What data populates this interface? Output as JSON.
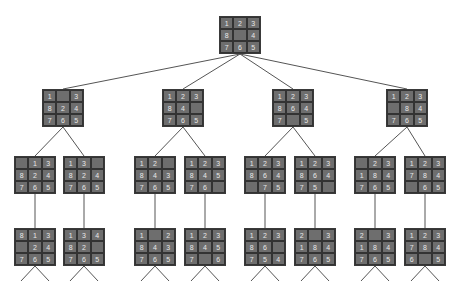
{
  "colors": {
    "tile": "#6e6e6e",
    "border": "#333333",
    "digit": "#e8e8e8",
    "edge": "#555555"
  },
  "nodes": [
    {
      "id": "root",
      "level": 1,
      "x": 219,
      "y": 16,
      "cells": [
        "1",
        "2",
        "3",
        "8",
        "",
        "4",
        "7",
        "6",
        "5"
      ]
    },
    {
      "id": "n2a",
      "level": 2,
      "x": 42,
      "y": 89,
      "cells": [
        "1",
        "",
        "3",
        "8",
        "2",
        "4",
        "7",
        "6",
        "5"
      ]
    },
    {
      "id": "n2b",
      "level": 2,
      "x": 162,
      "y": 89,
      "cells": [
        "1",
        "2",
        "3",
        "8",
        "4",
        "",
        "7",
        "6",
        "5"
      ]
    },
    {
      "id": "n2c",
      "level": 2,
      "x": 272,
      "y": 89,
      "cells": [
        "1",
        "2",
        "3",
        "8",
        "6",
        "4",
        "7",
        "",
        "5"
      ]
    },
    {
      "id": "n2d",
      "level": 2,
      "x": 386,
      "y": 89,
      "cells": [
        "1",
        "2",
        "3",
        "",
        "8",
        "4",
        "7",
        "6",
        "5"
      ]
    },
    {
      "id": "n3a",
      "level": 3,
      "x": 14,
      "y": 156,
      "cells": [
        "",
        "1",
        "3",
        "8",
        "2",
        "4",
        "7",
        "6",
        "5"
      ]
    },
    {
      "id": "n3b",
      "level": 3,
      "x": 63,
      "y": 156,
      "cells": [
        "1",
        "3",
        "",
        "8",
        "2",
        "4",
        "7",
        "6",
        "5"
      ]
    },
    {
      "id": "n3c",
      "level": 3,
      "x": 134,
      "y": 156,
      "cells": [
        "1",
        "2",
        "",
        "8",
        "4",
        "3",
        "7",
        "6",
        "5"
      ]
    },
    {
      "id": "n3d",
      "level": 3,
      "x": 184,
      "y": 156,
      "cells": [
        "1",
        "2",
        "3",
        "8",
        "4",
        "5",
        "7",
        "6",
        ""
      ]
    },
    {
      "id": "n3e",
      "level": 3,
      "x": 244,
      "y": 156,
      "cells": [
        "1",
        "2",
        "3",
        "8",
        "6",
        "4",
        "",
        "7",
        "5"
      ]
    },
    {
      "id": "n3f",
      "level": 3,
      "x": 294,
      "y": 156,
      "cells": [
        "1",
        "2",
        "3",
        "8",
        "6",
        "4",
        "7",
        "5",
        ""
      ]
    },
    {
      "id": "n3g",
      "level": 3,
      "x": 354,
      "y": 156,
      "cells": [
        "",
        "2",
        "3",
        "1",
        "8",
        "4",
        "7",
        "6",
        "5"
      ]
    },
    {
      "id": "n3h",
      "level": 3,
      "x": 404,
      "y": 156,
      "cells": [
        "1",
        "2",
        "3",
        "7",
        "8",
        "4",
        "",
        "6",
        "5"
      ]
    },
    {
      "id": "n4a",
      "level": 4,
      "x": 14,
      "y": 228,
      "cells": [
        "8",
        "1",
        "3",
        "",
        "2",
        "4",
        "7",
        "6",
        "5"
      ]
    },
    {
      "id": "n4b",
      "level": 4,
      "x": 63,
      "y": 228,
      "cells": [
        "1",
        "3",
        "4",
        "8",
        "2",
        "",
        "7",
        "6",
        "5"
      ]
    },
    {
      "id": "n4c",
      "level": 4,
      "x": 134,
      "y": 228,
      "cells": [
        "1",
        "",
        "2",
        "8",
        "4",
        "3",
        "7",
        "6",
        "5"
      ]
    },
    {
      "id": "n4d",
      "level": 4,
      "x": 184,
      "y": 228,
      "cells": [
        "1",
        "2",
        "3",
        "8",
        "4",
        "5",
        "7",
        "",
        "6"
      ]
    },
    {
      "id": "n4e",
      "level": 4,
      "x": 244,
      "y": 228,
      "cells": [
        "1",
        "2",
        "3",
        "8",
        "6",
        "",
        "7",
        "5",
        "4"
      ]
    },
    {
      "id": "n4f",
      "level": 4,
      "x": 294,
      "y": 228,
      "cells": [
        "2",
        "",
        "3",
        "1",
        "8",
        "4",
        "7",
        "6",
        "5"
      ]
    },
    {
      "id": "n4g",
      "level": 4,
      "x": 354,
      "y": 228,
      "cells": [
        "2",
        "",
        "3",
        "1",
        "8",
        "4",
        "7",
        "6",
        "5"
      ]
    },
    {
      "id": "n4h",
      "level": 4,
      "x": 404,
      "y": 228,
      "cells": [
        "1",
        "2",
        "3",
        "7",
        "8",
        "4",
        "6",
        "",
        "5"
      ]
    }
  ],
  "edges": [
    [
      "root",
      "n2a"
    ],
    [
      "root",
      "n2b"
    ],
    [
      "root",
      "n2c"
    ],
    [
      "root",
      "n2d"
    ],
    [
      "n2a",
      "n3a"
    ],
    [
      "n2a",
      "n3b"
    ],
    [
      "n2b",
      "n3c"
    ],
    [
      "n2b",
      "n3d"
    ],
    [
      "n2c",
      "n3e"
    ],
    [
      "n2c",
      "n3f"
    ],
    [
      "n2d",
      "n3g"
    ],
    [
      "n2d",
      "n3h"
    ],
    [
      "n3a",
      "n4a"
    ],
    [
      "n3b",
      "n4b"
    ],
    [
      "n3c",
      "n4c"
    ],
    [
      "n3d",
      "n4d"
    ],
    [
      "n3e",
      "n4e"
    ],
    [
      "n3f",
      "n4f"
    ],
    [
      "n3g",
      "n4g"
    ],
    [
      "n3h",
      "n4h"
    ]
  ],
  "leaf_branches": {
    "spread": 14,
    "length": 15
  }
}
